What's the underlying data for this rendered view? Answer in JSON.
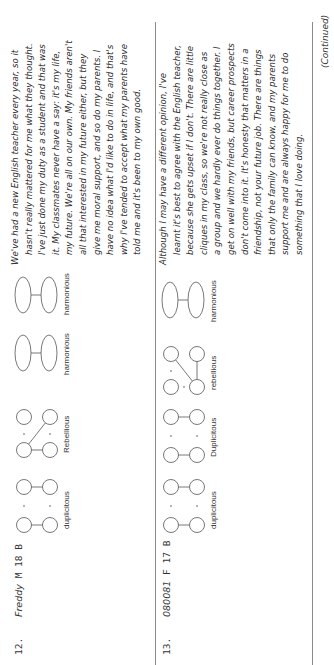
{
  "rows": [
    {
      "number": "12.",
      "name": "Freddy",
      "sex": "M",
      "age": "18",
      "group": "B",
      "diagrams": [
        {
          "type": "duplicitous",
          "label": "duplicitous"
        },
        {
          "type": "rebellious",
          "label": "Rebellious"
        },
        {
          "type": "harmonious",
          "label": "harmonious"
        },
        {
          "type": "harmonious",
          "label": "harmonious"
        }
      ],
      "text_lines": [
        "We've had a new English teacher every year, so it",
        "hasn't really mattered for me what they thought.",
        "I've just done my duty as a student and that was",
        "it. My classmates never have a say: it's my life,",
        "my future. We're all on our own. My friends aren't",
        "all that interested in my future either, but they",
        "give me moral support, and so do my parents. I",
        "have no idea what I'd like to do in life, and that's",
        "why I've tended to accept what my parents have",
        "told me and it's been to my own good."
      ]
    },
    {
      "number": "13.",
      "name": "080081",
      "sex": "F",
      "age": "17",
      "group": "B",
      "diagrams": [
        {
          "type": "duplicitous",
          "label": "duplicitous"
        },
        {
          "type": "duplicitous",
          "label": "Duplicitous"
        },
        {
          "type": "rebellious",
          "label": "rebellious"
        },
        {
          "type": "harmonious",
          "label": "harmonious"
        }
      ],
      "text_lines": [
        "Although I may have a different opinion, I've",
        "learnt it's best to agree with the English teacher,",
        "because she gets upset if I don't. There are little",
        "cliques in my class, so we're not really close as",
        "a group and we hardly ever do things together. I",
        "get on well with my friends, but career prospects",
        "don't come into it. It's honesty that matters in a",
        "friendship, not your future job. There are things",
        "that only the family can know, and my parents",
        "support me and are always happy for me to do",
        "something that I love doing."
      ]
    }
  ],
  "footer": {
    "continued": "(Continued)"
  },
  "colors": {
    "rule": "#8a8a8a",
    "text": "#2a2a2a"
  }
}
